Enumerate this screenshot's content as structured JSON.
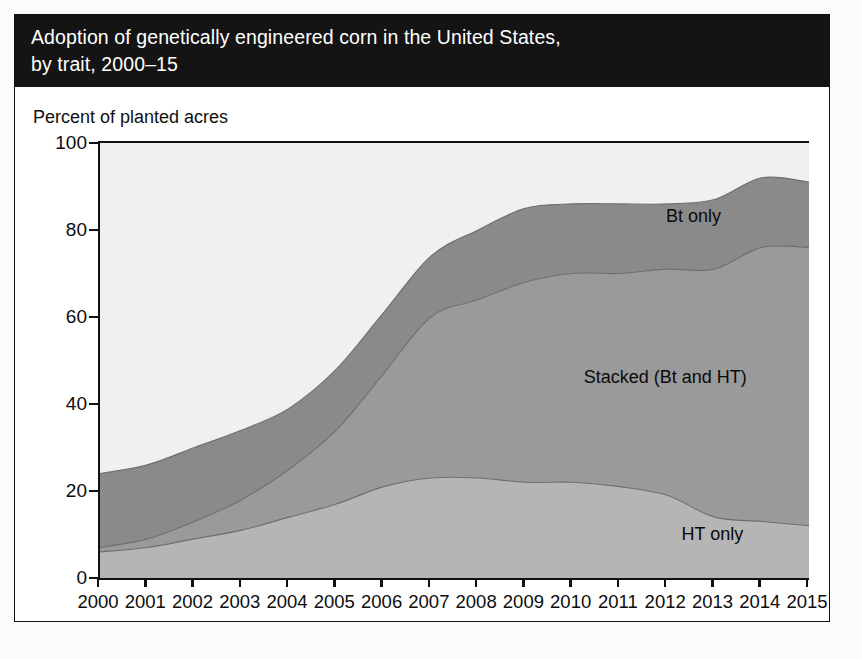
{
  "figure": {
    "title_line1": "Adoption of genetically engineered corn in the United States,",
    "title_line2": "by trait, 2000–15",
    "axis_note": "Percent of planted acres"
  },
  "colors": {
    "title_bar": "#141414",
    "title_text": "#ffffff",
    "plot_background": "#f0f0ef",
    "band_bt_only": "#8a8a8a",
    "band_stacked": "#9a9a9a",
    "band_ht_only": "#b5b5b5",
    "axis": "#111111",
    "tick_text": "#0c0c0c"
  },
  "chart_data": {
    "type": "area",
    "title": "Adoption of genetically engineered corn in the United States, by trait, 2000–15",
    "xlabel": "",
    "ylabel": "Percent of planted acres",
    "ylim": [
      0,
      100
    ],
    "yticks": [
      0,
      20,
      40,
      60,
      80,
      100
    ],
    "grid": false,
    "legend_position": "inline-annotations",
    "stacked": true,
    "x": [
      2000,
      2001,
      2002,
      2003,
      2004,
      2005,
      2006,
      2007,
      2008,
      2009,
      2010,
      2011,
      2012,
      2013,
      2014,
      2015
    ],
    "categories": [
      "2000",
      "2001",
      "2002",
      "2003",
      "2004",
      "2005",
      "2006",
      "2007",
      "2008",
      "2009",
      "2010",
      "2011",
      "2012",
      "2013",
      "2014",
      "2015"
    ],
    "series": [
      {
        "name": "HT only",
        "color": "#b5b5b5",
        "values": [
          6,
          7,
          9,
          11,
          14,
          17,
          21,
          23,
          23,
          22,
          22,
          21,
          19,
          14,
          13,
          12
        ]
      },
      {
        "name": "Stacked (Bt and HT)",
        "color": "#9a9a9a",
        "values": [
          1,
          2,
          4,
          7,
          11,
          17,
          26,
          37,
          41,
          46,
          48,
          49,
          52,
          57,
          63,
          64
        ]
      },
      {
        "name": "Bt only",
        "color": "#8a8a8a",
        "values": [
          17,
          17,
          17,
          16,
          14,
          14,
          14,
          14,
          16,
          17,
          16,
          16,
          15,
          16,
          16,
          15
        ]
      }
    ],
    "stack_top_totals": [
      24,
      26,
      30,
      34,
      39,
      48,
      61,
      74,
      80,
      85,
      86,
      86,
      86,
      87,
      92,
      91
    ],
    "annotations": [
      {
        "text": "Bt only",
        "x": 2012.6,
        "y": 83
      },
      {
        "text": "Stacked (Bt and HT)",
        "x": 2012.0,
        "y": 46
      },
      {
        "text": "HT only",
        "x": 2013.0,
        "y": 10
      }
    ]
  },
  "bleed_text": [
    "the pool of available tests is not as exhaustive",
    "order to levy a tax on",
    "8.5 %",
    "of a minor amount of disease-causing molds, fungi",
    "of possible tests that they may undertake to",
    "corn that is certified to be no greater than",
    "use of a double-cross method that included the crop",
    "adopt corn that is drought tolerant and herbicide toxin",
    "is in conventional corn and soybean at the rate where",
    "be useful to grow in the grain milling and",
    "the dry milling industry use to incorporate through",
    "base materials",
    "corn is used in"
  ]
}
